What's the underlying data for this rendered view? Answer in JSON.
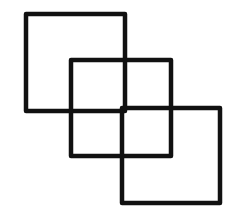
{
  "diagram": {
    "type": "overlapping-squares",
    "background": "#ffffff",
    "stroke_color": "#111111",
    "stroke_width": 4.5,
    "shapes": [
      {
        "id": "square-1",
        "x": 26,
        "y": 14,
        "width": 99,
        "height": 97
      },
      {
        "id": "square-2",
        "x": 71,
        "y": 60,
        "width": 100,
        "height": 96
      },
      {
        "id": "square-3",
        "x": 122,
        "y": 108,
        "width": 98,
        "height": 95
      }
    ]
  }
}
